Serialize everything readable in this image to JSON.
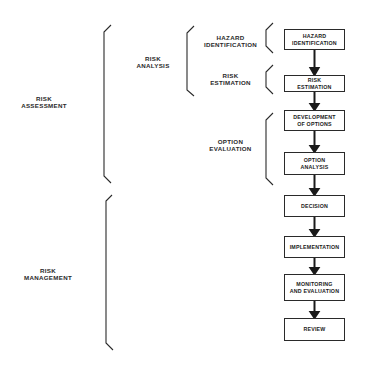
{
  "diagram": {
    "groups": {
      "risk_assessment": "RISK\nASSESSMENT",
      "risk_management": "RISK\nMANAGEMENT",
      "risk_analysis": "RISK\nANALYSIS",
      "hazard_identification": "HAZARD\nIDENTIFICATION",
      "risk_estimation": "RISK\nESTIMATION",
      "option_evaluation": "OPTION\nEVALUATION"
    },
    "steps": [
      {
        "label": "HAZARD\nIDENTIFICATION"
      },
      {
        "label": "RISK\nESTIMATION"
      },
      {
        "label": "DEVELOPMENT\nOF OPTIONS"
      },
      {
        "label": "OPTION\nANALYSIS"
      },
      {
        "label": "DECISION"
      },
      {
        "label": "IMPLEMENTATION"
      },
      {
        "label": "MONITORING\nAND EVALUATION"
      },
      {
        "label": "REVIEW"
      }
    ],
    "colors": {
      "line": "#2a2a2a",
      "background": "#ffffff"
    }
  }
}
